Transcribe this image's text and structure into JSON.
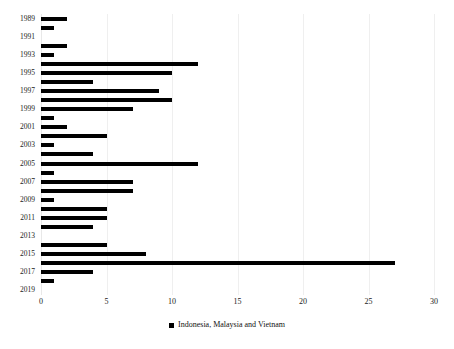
{
  "chart_data": {
    "type": "bar",
    "orientation": "horizontal",
    "title": "",
    "subtitle": "",
    "xlabel": "",
    "ylabel": "",
    "xlim": [
      0,
      30
    ],
    "xticks": [
      0,
      5,
      10,
      15,
      20,
      25,
      30
    ],
    "xtick_labels": [
      "0",
      "5",
      "10",
      "15",
      "20",
      "25",
      "30"
    ],
    "grid": true,
    "grid_axis": "x",
    "legend_position": "bottom",
    "bar_color": "#000000",
    "categories": [
      "1989",
      "1990",
      "1991",
      "1992",
      "1993",
      "1994",
      "1995",
      "1996",
      "1997",
      "1998",
      "1999",
      "2000",
      "2001",
      "2002",
      "2003",
      "2004",
      "2005",
      "2006",
      "2007",
      "2008",
      "2009",
      "2010",
      "2011",
      "2012",
      "2013",
      "2014",
      "2015",
      "2016",
      "2017",
      "2018",
      "2019"
    ],
    "ytick_labels": [
      "1989",
      "1991",
      "1993",
      "1995",
      "1997",
      "1999",
      "2001",
      "2003",
      "2005",
      "2007",
      "2009",
      "2011",
      "2013",
      "2015",
      "2017",
      "2019"
    ],
    "series": [
      {
        "name": "Indonesia, Malaysia and Vietnam",
        "color": "#000000",
        "values": [
          2,
          1,
          0,
          2,
          1,
          12,
          10,
          4,
          9,
          10,
          7,
          1,
          2,
          5,
          1,
          4,
          12,
          1,
          7,
          7,
          1,
          5,
          5,
          4,
          0,
          5,
          8,
          27,
          4,
          1,
          0
        ]
      }
    ]
  },
  "legend": {
    "entries": [
      {
        "label": "Indonesia, Malaysia and Vietnam",
        "marker": "square-marker"
      }
    ]
  }
}
